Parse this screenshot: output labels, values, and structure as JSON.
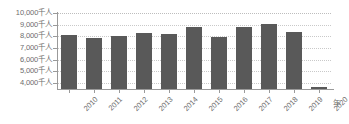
{
  "chart_data": {
    "type": "bar",
    "title": "",
    "subtitle": "",
    "xlabel": "年",
    "ylabel": "",
    "unit_suffix": "千人",
    "categories": [
      "2010",
      "2011",
      "2012",
      "2013",
      "2014",
      "2015",
      "2016",
      "2017",
      "2018",
      "2019",
      "2020"
    ],
    "values": [
      8100,
      7850,
      8050,
      8250,
      8180,
      8800,
      7950,
      8800,
      9050,
      8350,
      3700
    ],
    "ylim": [
      3500,
      10000
    ],
    "y_ticks": [
      4000,
      5000,
      6000,
      7000,
      8000,
      9000,
      10000
    ],
    "y_tick_labels": [
      "4,000千人",
      "5,000千人",
      "6,000千人",
      "7,000千人",
      "8,000千人",
      "9,000千人",
      "10,000千人"
    ],
    "x_tick_labels": [
      "2010",
      "2011",
      "2012",
      "2013",
      "2014",
      "2015",
      "2016",
      "2017",
      "2018",
      "2019",
      "2020"
    ],
    "grid": true,
    "grid_style": "dotted-horizontal",
    "legend": null,
    "legend_position": "none",
    "series": [
      {
        "name": "人数",
        "color": "#595959",
        "values": [
          8100,
          7850,
          8050,
          8250,
          8180,
          8800,
          7950,
          8800,
          9050,
          8350,
          3700
        ]
      }
    ]
  },
  "style": {
    "bar_color": "#595959",
    "grid_color": "#c9c9c9",
    "axis_color": "#9a9a9a",
    "text_color": "#6d6d6d",
    "background": "#ffffff"
  }
}
